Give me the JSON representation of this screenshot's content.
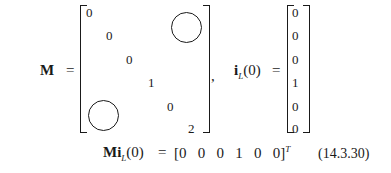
{
  "equation": {
    "lhs_matrix": "M",
    "equals": "=",
    "matrix_M_diagonal": [
      "0",
      "0",
      "0",
      "1",
      "0",
      "2"
    ],
    "comma": ",",
    "vector_label_bold": "i",
    "vector_label_sub": "L",
    "vector_label_arg": "(0)",
    "vector_values": [
      "0",
      "0",
      "0",
      "1",
      "0",
      "0"
    ],
    "product_lhs_bold": "Mi",
    "product_lhs_sub": "L",
    "product_lhs_arg": "(0)",
    "product_rhs": "[0   0   0   1   0   0]",
    "product_rhs_sup": "T",
    "equation_number": "(14.3.30)"
  }
}
